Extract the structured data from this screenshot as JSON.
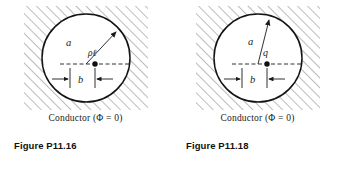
{
  "page": {
    "background": "#ffffff",
    "ink": "#1a1a1a"
  },
  "figures": [
    {
      "id": "fig-p11-16",
      "caption": "Conductor (Φ = 0)",
      "label": "Figure P11.16",
      "radius_label": "a",
      "offset_label": "b",
      "source_label": "ρℓ",
      "source_type": "line-charge",
      "circle": {
        "cx": 86,
        "cy": 58,
        "r": 44
      },
      "charge_dot": {
        "cx": 95,
        "cy": 64,
        "r": 2.6
      },
      "radius_arrow": {
        "x1": 86,
        "y1": 64,
        "x2": 118,
        "y2": 30
      },
      "hatch_angle_deg": 45,
      "hatch_color": "#8a8a8a"
    },
    {
      "id": "fig-p11-18",
      "caption": "Conductor (Φ = 0)",
      "label": "Figure P11.18",
      "radius_label": "a",
      "offset_label": "b",
      "source_label": "q",
      "source_type": "point-charge",
      "circle": {
        "cx": 86,
        "cy": 58,
        "r": 44
      },
      "charge_dot": {
        "cx": 95,
        "cy": 64,
        "r": 2.6
      },
      "radius_arrow": {
        "x1": 86,
        "y1": 64,
        "x2": 98,
        "y2": 22
      },
      "hatch_angle_deg": 45,
      "hatch_color": "#8a8a8a"
    }
  ]
}
